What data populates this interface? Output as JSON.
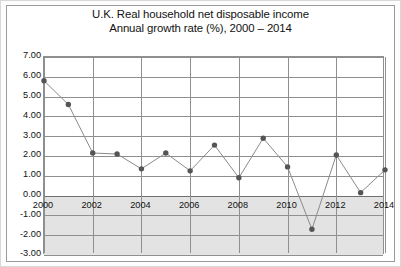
{
  "figure": {
    "title_line1": "U.K. Real household net disposable income",
    "title_line2": "Annual growth rate (%), 2000 – 2014",
    "title_full": "U.K. Real household net disposable income\nAnnual growth rate (%), 2000 – 2014"
  },
  "axes": {
    "y_tick_labels": [
      "7.00",
      "6.00",
      "5.00",
      "4.00",
      "3.00",
      "2.00",
      "1.00",
      "0.00",
      "-1.00",
      "-2.00",
      "-3.00"
    ],
    "x_tick_labels": [
      "2000",
      "2002",
      "2004",
      "2006",
      "2008",
      "2010",
      "2012",
      "2014"
    ]
  },
  "colors": {
    "marker": "#555555",
    "line": "#8a8a8a",
    "grid": "#8f8f8f",
    "frame": "#9a9a9a",
    "negative_band": "#e3e3e3",
    "background": "#ffffff",
    "text": "#111111"
  },
  "chart_data": {
    "type": "line",
    "title": "U.K. Real household net disposable income Annual growth rate (%), 2000 – 2014",
    "xlabel": "",
    "ylabel": "",
    "x": [
      2000,
      2001,
      2002,
      2003,
      2004,
      2005,
      2006,
      2007,
      2008,
      2009,
      2010,
      2011,
      2012,
      2013,
      2014
    ],
    "values": [
      5.8,
      4.6,
      2.15,
      2.1,
      1.35,
      2.15,
      1.25,
      2.55,
      0.9,
      2.9,
      1.45,
      -1.7,
      2.05,
      0.15,
      1.3
    ],
    "series": [
      {
        "name": "Annual growth rate (%)",
        "values": [
          5.8,
          4.6,
          2.15,
          2.1,
          1.35,
          2.15,
          1.25,
          2.55,
          0.9,
          2.9,
          1.45,
          -1.7,
          2.05,
          0.15,
          1.3
        ]
      }
    ],
    "ylim": [
      -3.0,
      7.0
    ],
    "ytick_step": 1.0,
    "xlim": [
      2000,
      2014
    ],
    "xtick_step": 2,
    "xtick_labels": [
      "2000",
      "2002",
      "2004",
      "2006",
      "2008",
      "2010",
      "2012",
      "2014"
    ],
    "ytick_labels": [
      "7.00",
      "6.00",
      "5.00",
      "4.00",
      "3.00",
      "2.00",
      "1.00",
      "0.00",
      "-1.00",
      "-2.00",
      "-3.00"
    ],
    "grid": true,
    "legend": false,
    "markers": true,
    "marker_shape": "circle"
  }
}
